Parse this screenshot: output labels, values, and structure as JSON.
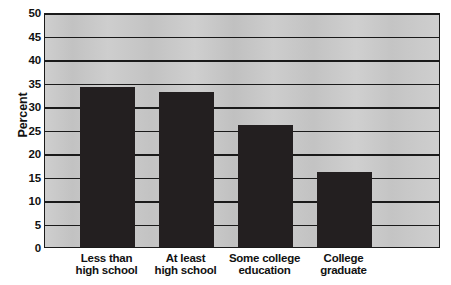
{
  "chart_data": {
    "type": "bar",
    "title": "",
    "subtitle": "",
    "xlabel": "",
    "ylabel": "Percent",
    "categories": [
      "Less than high school",
      "At least high school",
      "Some college education",
      "College graduate"
    ],
    "category_lines": [
      [
        "Less than",
        "high school"
      ],
      [
        "At least",
        "high school"
      ],
      [
        "Some college",
        "education"
      ],
      [
        "College",
        "graduate"
      ]
    ],
    "values": [
      34,
      33,
      26,
      16
    ],
    "ylim": [
      0,
      50
    ],
    "ytick_step": 5,
    "ytick_labels": [
      "50",
      "45",
      "40",
      "35",
      "30",
      "25",
      "20",
      "15",
      "10",
      "5",
      "0"
    ],
    "ytick_values": [
      50,
      45,
      40,
      35,
      30,
      25,
      20,
      15,
      10,
      5,
      0
    ],
    "grid": true,
    "grid_orientation": "horizontal",
    "legend": false,
    "legend_position": "none",
    "bar_color": "#231f20",
    "plot_background_color": "#c9c9c9",
    "axis_color": "#1a1a1a",
    "page_background_color": "#ffffff",
    "text_color": "#111111"
  }
}
